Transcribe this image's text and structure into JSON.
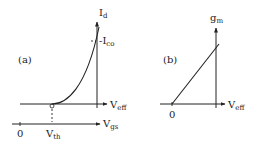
{
  "panels": [
    {
      "id": "a",
      "label": "(a)",
      "y_axis": {
        "main": "I",
        "sub": "d"
      },
      "x_axis": {
        "main": "V",
        "sub": "eff"
      },
      "second_x_axis": {
        "main": "V",
        "sub": "gs"
      },
      "marker": {
        "main": "-I",
        "sub": "co"
      },
      "origin_label": "0",
      "threshold_label": {
        "main": "V",
        "sub": "th"
      },
      "threshold_point_label": "0"
    },
    {
      "id": "b",
      "label": "(b)",
      "y_axis": {
        "main": "g",
        "sub": "m"
      },
      "x_axis": {
        "main": "V",
        "sub": "eff"
      },
      "origin_label": "0"
    }
  ]
}
